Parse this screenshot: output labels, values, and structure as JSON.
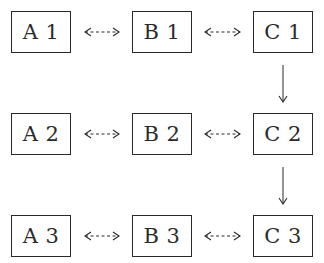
{
  "diagram": {
    "nodes": [
      {
        "id": "A1",
        "label": "A 1",
        "row": 1,
        "col": "A"
      },
      {
        "id": "B1",
        "label": "B 1",
        "row": 1,
        "col": "B"
      },
      {
        "id": "C1",
        "label": "C 1",
        "row": 1,
        "col": "C"
      },
      {
        "id": "A2",
        "label": "A 2",
        "row": 2,
        "col": "A"
      },
      {
        "id": "B2",
        "label": "B 2",
        "row": 2,
        "col": "B"
      },
      {
        "id": "C2",
        "label": "C 2",
        "row": 2,
        "col": "C"
      },
      {
        "id": "A3",
        "label": "A 3",
        "row": 3,
        "col": "A"
      },
      {
        "id": "B3",
        "label": "B 3",
        "row": 3,
        "col": "B"
      },
      {
        "id": "C3",
        "label": "C 3",
        "row": 3,
        "col": "C"
      }
    ],
    "edges": [
      {
        "from": "A1",
        "to": "B1",
        "style": "dashed",
        "direction": "bidirectional"
      },
      {
        "from": "B1",
        "to": "C1",
        "style": "dashed",
        "direction": "bidirectional"
      },
      {
        "from": "A2",
        "to": "B2",
        "style": "dashed",
        "direction": "bidirectional"
      },
      {
        "from": "B2",
        "to": "C2",
        "style": "dashed",
        "direction": "bidirectional"
      },
      {
        "from": "A3",
        "to": "B3",
        "style": "dashed",
        "direction": "bidirectional"
      },
      {
        "from": "B3",
        "to": "C3",
        "style": "dashed",
        "direction": "bidirectional"
      },
      {
        "from": "C1",
        "to": "C2",
        "style": "solid",
        "direction": "forward"
      },
      {
        "from": "C2",
        "to": "C3",
        "style": "solid",
        "direction": "forward"
      }
    ],
    "colors": {
      "stroke": "#2a2a2a",
      "background": "#ffffff"
    }
  }
}
